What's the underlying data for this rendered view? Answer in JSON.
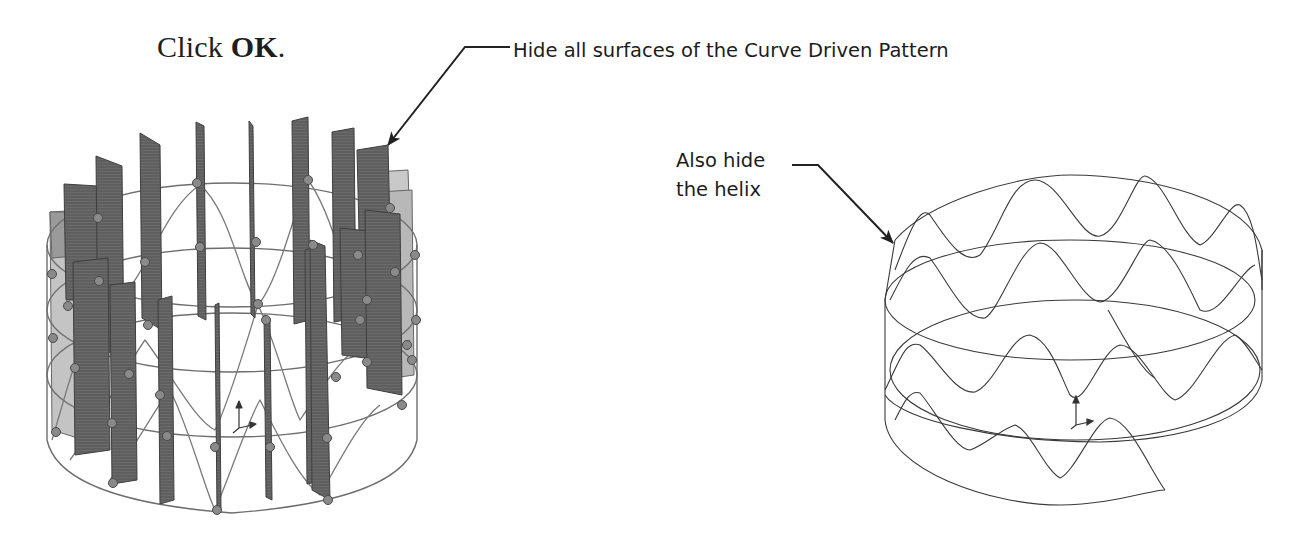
{
  "step": {
    "prefix": "Click ",
    "button_name": "OK",
    "suffix": "."
  },
  "callouts": {
    "surfaces": "Hide all surfaces of the Curve Driven Pattern",
    "helix_line1": "Also hide",
    "helix_line2": "the helix"
  },
  "figures": {
    "left": {
      "description": "Cylindrical wireframe with sinusoidal helix curve, sketch points and 18 patterned planar surfaces (before hiding)",
      "surface_color": "#5e5e5e",
      "surface_light_color": "#c9c9c9",
      "point_color": "#7a7a7a"
    },
    "right": {
      "description": "Same wireframe after hiding surfaces: rings and sinusoidal helix-wrapped curve",
      "line_color": "#3a3a3a"
    },
    "icons": {
      "triad": "coordinate-triad-icon"
    }
  },
  "colors": {
    "text": "#1e1e1e",
    "leader": "#222222",
    "background": "#ffffff"
  }
}
